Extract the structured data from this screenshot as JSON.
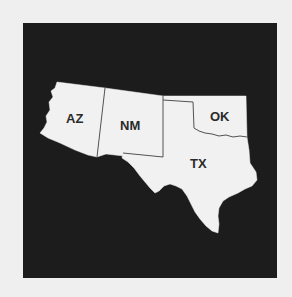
{
  "map": {
    "title": "",
    "background_color": "#efefef",
    "frame_color": "#1c1c1c",
    "state_fill": "#f1f1f1",
    "border_color": "#555555",
    "states": [
      {
        "abbr": "AZ",
        "label": "AZ",
        "label_x": 75,
        "label_y": 123
      },
      {
        "abbr": "NM",
        "label": "NM",
        "label_x": 130,
        "label_y": 130
      },
      {
        "abbr": "OK",
        "label": "OK",
        "label_x": 220,
        "label_y": 121
      },
      {
        "abbr": "TX",
        "label": "TX",
        "label_x": 199,
        "label_y": 168
      }
    ]
  }
}
